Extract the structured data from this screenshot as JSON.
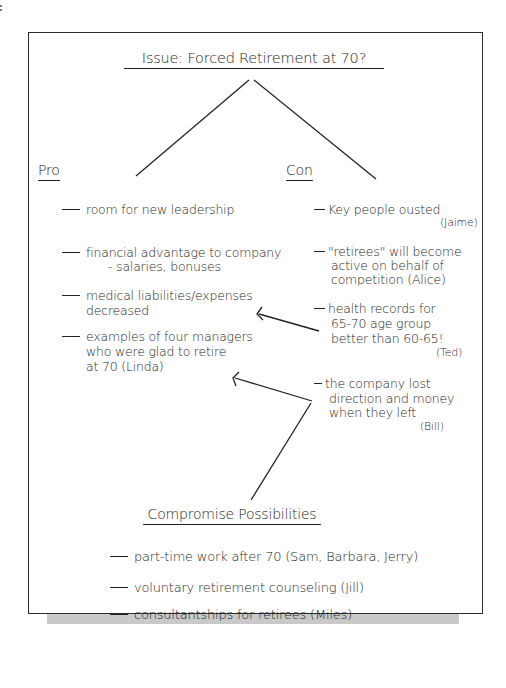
{
  "diagram": {
    "title": "Issue: Forced Retirement at 70?",
    "pro": {
      "heading": "Pro",
      "items": [
        {
          "text": "room for new leadership"
        },
        {
          "text": "financial advantage to company",
          "sub": "- salaries, bonuses"
        },
        {
          "text": "medical liabilities/expenses",
          "cont": "decreased"
        },
        {
          "text": "examples of four managers",
          "cont": "who were glad to retire",
          "cont2": "at 70 (Linda)"
        }
      ]
    },
    "con": {
      "heading": "Con",
      "items": [
        {
          "text": "Key people ousted",
          "attribution": "(Jaime)"
        },
        {
          "text": "\"retirees\" will become",
          "cont": "active on behalf of",
          "cont2": "competition (Alice)"
        },
        {
          "text": "health records for",
          "cont": "65-70 age group",
          "cont2": "better than 60-65!",
          "attribution": "(Ted)"
        },
        {
          "text": "the company lost",
          "cont": "direction and money",
          "cont2": "when they left",
          "attribution": "(Bill)"
        }
      ]
    },
    "compromise": {
      "heading": "Compromise Possibilities",
      "items": [
        {
          "text": "part-time work after 70 (Sam, Barbara, Jerry)"
        },
        {
          "text": "voluntary retirement counseling (Jill)"
        },
        {
          "text": "consultantships for retirees (Miles)"
        }
      ]
    },
    "connections": [
      {
        "from": "title",
        "to": "pro",
        "type": "line"
      },
      {
        "from": "title",
        "to": "con",
        "type": "line"
      },
      {
        "from": "con.items.2",
        "to": "pro.items.2",
        "type": "arrow"
      },
      {
        "from": "con.items.3",
        "to": "pro.items.3",
        "type": "arrow"
      },
      {
        "from": "con.items.3",
        "to": "compromise",
        "type": "line"
      }
    ]
  }
}
